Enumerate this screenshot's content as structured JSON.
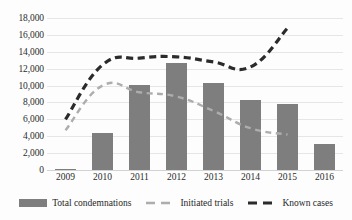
{
  "chart_data": {
    "type": "bar",
    "title": "",
    "subtitle": "",
    "xlabel": "",
    "ylabel": "",
    "categories": [
      "2009",
      "2010",
      "2011",
      "2012",
      "2013",
      "2014",
      "2015",
      "2016"
    ],
    "ylim": [
      0,
      18000
    ],
    "ytick_values": [
      0,
      2000,
      4000,
      6000,
      8000,
      10000,
      12000,
      14000,
      16000,
      18000
    ],
    "ytick_labels": [
      "0",
      "2,000",
      "4,000",
      "6,000",
      "8,000",
      "10,000",
      "12,000",
      "14,000",
      "16,000",
      "18,000"
    ],
    "grid": true,
    "legend_position": "bottom",
    "series": [
      {
        "name": "Total condemnations",
        "render": "bar",
        "color": "#7e7e7e",
        "values": [
          100,
          4400,
          10100,
          12700,
          10300,
          8250,
          7800,
          3100
        ]
      },
      {
        "name": "Initiated trials",
        "render": "line-dashed",
        "color": "#adadad",
        "values": [
          4700,
          10000,
          9200,
          8700,
          7000,
          4950,
          4200,
          null
        ]
      },
      {
        "name": "Known cases",
        "render": "line-dashed",
        "color": "#2b2b2b",
        "values": [
          6000,
          12450,
          13250,
          13400,
          12800,
          12200,
          16800,
          null
        ]
      }
    ]
  },
  "legend": {
    "items": [
      {
        "label": "Total condemnations",
        "marker": "bar-swatch",
        "color": "#7e7e7e"
      },
      {
        "label": "Initiated trials",
        "marker": "dashed-line-swatch",
        "color": "#adadad"
      },
      {
        "label": "Known cases",
        "marker": "dashed-line-swatch",
        "color": "#2b2b2b"
      }
    ]
  }
}
